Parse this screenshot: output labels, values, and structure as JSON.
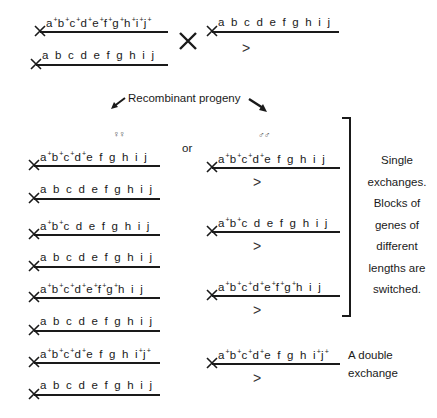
{
  "parents": {
    "female_top": {
      "genes": [
        "a+",
        "b+",
        "c+",
        "d+",
        "e+",
        "f+",
        "g+",
        "h+",
        "i+",
        "j+"
      ]
    },
    "female_bottom": {
      "genes": [
        "a",
        "b",
        "c",
        "d",
        "e",
        "f",
        "g",
        "h",
        "i",
        "j"
      ]
    },
    "cross_symbol": "×",
    "male": {
      "genes": [
        "a",
        "b",
        "c",
        "d",
        "e",
        "f",
        "g",
        "h",
        "i",
        "j"
      ],
      "y_marker": ">"
    }
  },
  "labels": {
    "recombinant": "Recombinant progeny",
    "females": "♀♀",
    "or": "or",
    "males": "♂♂",
    "single_exchange_lines": [
      "Single",
      "exchanges.",
      "Blocks of",
      "genes of",
      "different",
      "lengths are",
      "switched."
    ],
    "double_exchange_lines": [
      "A double",
      "exchange"
    ]
  },
  "female_progeny": [
    {
      "top": [
        "a+",
        "b+",
        "c+",
        "d+",
        "e",
        "f",
        "g",
        "h",
        "i",
        "j"
      ],
      "bottom": [
        "a",
        "b",
        "c",
        "d",
        "e",
        "f",
        "g",
        "h",
        "i",
        "j"
      ]
    },
    {
      "top": [
        "a+",
        "b+",
        "c",
        "d",
        "e",
        "f",
        "g",
        "h",
        "i",
        "j"
      ],
      "bottom": [
        "a",
        "b",
        "c",
        "d",
        "e",
        "f",
        "g",
        "h",
        "i",
        "j"
      ]
    },
    {
      "top": [
        "a+",
        "b+",
        "c+",
        "d+",
        "e+",
        "f+",
        "g+",
        "h",
        "i",
        "j"
      ],
      "bottom": [
        "a",
        "b",
        "c",
        "d",
        "e",
        "f",
        "g",
        "h",
        "i",
        "j"
      ]
    },
    {
      "top": [
        "a+",
        "b+",
        "c+",
        "d+",
        "e",
        "f",
        "g",
        "h",
        "i+",
        "j+"
      ],
      "bottom": [
        "a",
        "b",
        "c",
        "d",
        "e",
        "f",
        "g",
        "h",
        "i",
        "j"
      ]
    }
  ],
  "male_progeny": [
    {
      "genes": [
        "a+",
        "b+",
        "c+",
        "d+",
        "e",
        "f",
        "g",
        "h",
        "i",
        "j"
      ],
      "y_marker": ">"
    },
    {
      "genes": [
        "a+",
        "b+",
        "c",
        "d",
        "e",
        "f",
        "g",
        "h",
        "i",
        "j"
      ],
      "y_marker": ">"
    },
    {
      "genes": [
        "a+",
        "b+",
        "c+",
        "d+",
        "e+",
        "f+",
        "g+",
        "h",
        "i",
        "j"
      ],
      "y_marker": ">"
    },
    {
      "genes": [
        "a+",
        "b+",
        "c+",
        "d+",
        "e",
        "f",
        "g",
        "h",
        "i+",
        "j+"
      ],
      "y_marker": ">"
    }
  ]
}
